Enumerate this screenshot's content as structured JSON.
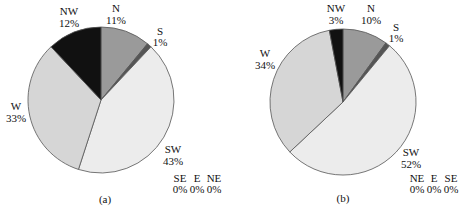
{
  "chart_data": [
    {
      "type": "pie",
      "caption": "(a)",
      "start": "top, clockwise",
      "slices": [
        {
          "label": "N",
          "value": 11,
          "display": "11%",
          "color": "#9a9a9a"
        },
        {
          "label": "S",
          "value": 1,
          "display": "1%",
          "color": "#555555"
        },
        {
          "label": "SW",
          "value": 43,
          "display": "43%",
          "color": "#ececec"
        },
        {
          "label": "W",
          "value": 33,
          "display": "33%",
          "color": "#d6d6d6"
        },
        {
          "label": "NW",
          "value": 12,
          "display": "12%",
          "color": "#111111"
        }
      ],
      "zero_labels": [
        {
          "label": "SE",
          "display": "0%"
        },
        {
          "label": "E",
          "display": "0%"
        },
        {
          "label": "NE",
          "display": "0%"
        }
      ]
    },
    {
      "type": "pie",
      "caption": "(b)",
      "start": "top, clockwise",
      "slices": [
        {
          "label": "N",
          "value": 10,
          "display": "10%",
          "color": "#9a9a9a"
        },
        {
          "label": "S",
          "value": 1,
          "display": "1%",
          "color": "#555555"
        },
        {
          "label": "SW",
          "value": 52,
          "display": "52%",
          "color": "#ececec"
        },
        {
          "label": "W",
          "value": 34,
          "display": "34%",
          "color": "#d6d6d6"
        },
        {
          "label": "NW",
          "value": 3,
          "display": "3%",
          "color": "#111111"
        }
      ],
      "zero_labels": [
        {
          "label": "NE",
          "display": "0%"
        },
        {
          "label": "E",
          "display": "0%"
        },
        {
          "label": "SE",
          "display": "0%"
        }
      ]
    }
  ]
}
